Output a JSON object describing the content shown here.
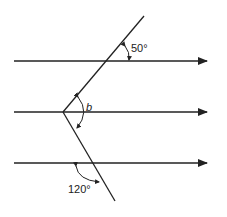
{
  "diagram": {
    "type": "parallel-lines-angles",
    "labels": {
      "top_angle": "50°",
      "middle_angle": "b",
      "bottom_angle": "120°"
    },
    "parallel_lines": 3,
    "colors": {
      "stroke": "#222222",
      "background": "#ffffff"
    }
  }
}
